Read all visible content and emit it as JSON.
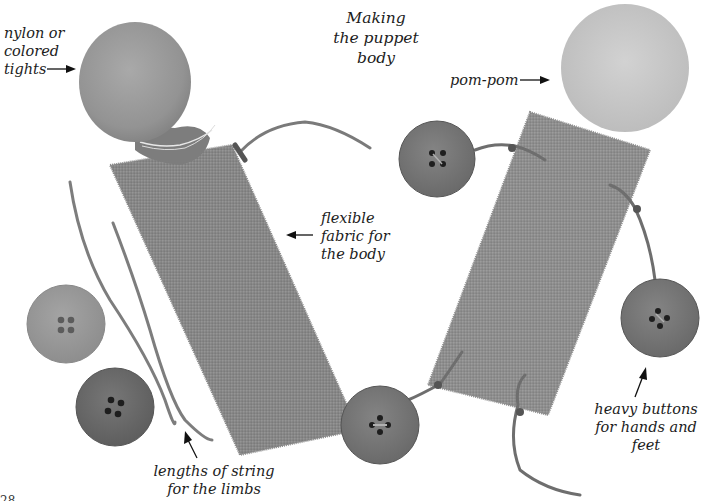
{
  "title": {
    "lines": [
      "Making",
      "the puppet",
      "body"
    ]
  },
  "labels": {
    "tights": [
      "nylon or",
      "colored",
      "tights"
    ],
    "fabric": [
      "flexible",
      "fabric for",
      "the body"
    ],
    "strings": [
      "lengths of string",
      "for the limbs"
    ],
    "pompom": [
      "pom-pom"
    ],
    "buttons": [
      "heavy buttons",
      "for hands and",
      "feet"
    ]
  },
  "page_number_fragment": "28",
  "colors": {
    "background": "#ffffff",
    "fabric": "#8a8a8a",
    "tights_ball": "#9a9a9a",
    "pompom": "#c8c8c8",
    "button_light": "#9c9c9c",
    "button_dark": "#6e6e6e",
    "string": "#7a7a7a",
    "text": "#1c1c1c"
  }
}
